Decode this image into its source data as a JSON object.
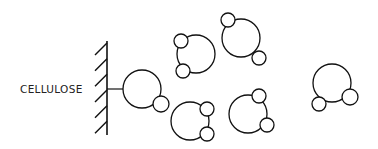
{
  "diagram": {
    "label": "CELLULOSE",
    "stroke_color": "#111111",
    "background": "#ffffff",
    "wall": {
      "x": 107,
      "y1": 41,
      "y2": 135,
      "hatch_count": 6
    },
    "connector": {
      "x1": 107,
      "x2": 123,
      "y": 89
    },
    "molecules": [
      {
        "id": "tethered",
        "big": [
          142,
          89,
          19
        ],
        "small": [
          [
            161,
            104,
            8
          ]
        ]
      },
      {
        "id": "free-1",
        "big": [
          196,
          54,
          19
        ],
        "small": [
          [
            181,
            41,
            7
          ],
          [
            183,
            71,
            7
          ]
        ]
      },
      {
        "id": "free-2",
        "big": [
          241,
          38,
          19
        ],
        "small": [
          [
            228,
            20,
            7
          ],
          [
            259,
            58,
            7
          ]
        ]
      },
      {
        "id": "free-3",
        "big": [
          190,
          121,
          19
        ],
        "small": [
          [
            207,
            109,
            7
          ],
          [
            207,
            134,
            7
          ]
        ]
      },
      {
        "id": "free-4",
        "big": [
          248,
          114,
          19
        ],
        "small": [
          [
            259,
            96,
            7
          ],
          [
            267,
            125,
            7
          ]
        ]
      },
      {
        "id": "free-5",
        "big": [
          332,
          83,
          19
        ],
        "small": [
          [
            350,
            97,
            8
          ],
          [
            319,
            104,
            7
          ]
        ]
      }
    ]
  }
}
